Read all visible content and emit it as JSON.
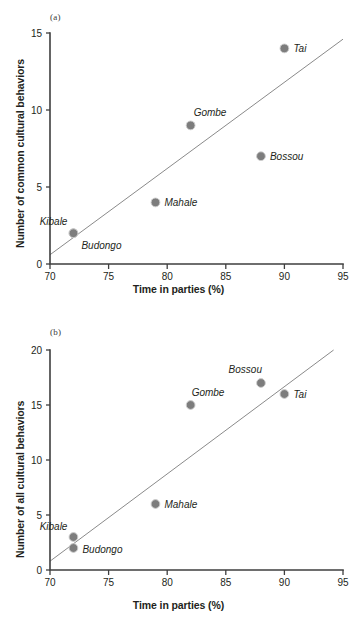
{
  "figure": {
    "panels": [
      "a",
      "b"
    ]
  },
  "panel_a": {
    "tag": "(a)",
    "xlabel": "Time in parties (%)",
    "ylabel": "Number of common cultural behaviors"
  },
  "panel_b": {
    "tag": "(b)",
    "xlabel": "Time in parties (%)",
    "ylabel": "Number of all cultural behaviors"
  },
  "chart_data": [
    {
      "type": "scatter",
      "panel": "(a)",
      "title": "",
      "xlabel": "Time in parties (%)",
      "ylabel": "Number of common cultural behaviors",
      "xlim": [
        70,
        95
      ],
      "ylim": [
        0,
        15
      ],
      "xticks": [
        70,
        75,
        80,
        85,
        90,
        95
      ],
      "yticks": [
        0,
        5,
        10,
        15
      ],
      "grid": false,
      "legend": "none",
      "points": [
        {
          "label": "Kibale",
          "x": 72,
          "y": 2,
          "label_dx": -6,
          "label_dy": -8,
          "anchor": "end"
        },
        {
          "label": "Budongo",
          "x": 72,
          "y": 2,
          "label_dx": 8,
          "label_dy": 16,
          "anchor": "start"
        },
        {
          "label": "Mahale",
          "x": 79,
          "y": 4,
          "label_dx": 9,
          "label_dy": 4,
          "anchor": "start"
        },
        {
          "label": "Gombe",
          "x": 82,
          "y": 9,
          "label_dx": 3,
          "label_dy": -9,
          "anchor": "start"
        },
        {
          "label": "Bossou",
          "x": 88,
          "y": 7,
          "label_dx": 9,
          "label_dy": 4,
          "anchor": "start"
        },
        {
          "label": "Tai",
          "x": 90,
          "y": 14,
          "label_dx": 9,
          "label_dy": 4,
          "anchor": "start"
        }
      ],
      "trend_line": {
        "x1": 70,
        "y1": 0.6,
        "x2": 95,
        "y2": 14.6
      }
    },
    {
      "type": "scatter",
      "panel": "(b)",
      "title": "",
      "xlabel": "Time in parties (%)",
      "ylabel": "Number of all cultural behaviors",
      "xlim": [
        70,
        95
      ],
      "ylim": [
        0,
        20
      ],
      "xticks": [
        70,
        75,
        80,
        85,
        90,
        95
      ],
      "yticks": [
        0,
        5,
        10,
        15,
        20
      ],
      "grid": false,
      "legend": "none",
      "points": [
        {
          "label": "Budongo",
          "x": 72,
          "y": 2,
          "label_dx": 9,
          "label_dy": 5,
          "anchor": "start"
        },
        {
          "label": "Kibale",
          "x": 72,
          "y": 3,
          "label_dx": -6,
          "label_dy": -7,
          "anchor": "end"
        },
        {
          "label": "Mahale",
          "x": 79,
          "y": 6,
          "label_dx": 9,
          "label_dy": 4,
          "anchor": "start"
        },
        {
          "label": "Gombe",
          "x": 82,
          "y": 15,
          "label_dx": 1,
          "label_dy": -9,
          "anchor": "start"
        },
        {
          "label": "Bossou",
          "x": 88,
          "y": 17,
          "label_dx": 1,
          "label_dy": -10,
          "anchor": "end"
        },
        {
          "label": "Tai",
          "x": 90,
          "y": 16,
          "label_dx": 9,
          "label_dy": 4,
          "anchor": "start"
        }
      ],
      "trend_line": {
        "x1": 70,
        "y1": 0.8,
        "x2": 94.2,
        "y2": 20.0
      }
    }
  ],
  "colors": {
    "marker_fill": "#7d7d7d",
    "marker_stroke": "#cfcfcf",
    "axis": "#3f3f3f",
    "trend": "#8a8a8a",
    "text": "#231f20"
  }
}
